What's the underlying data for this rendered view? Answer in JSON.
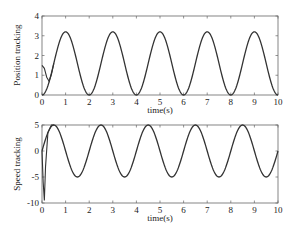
{
  "chart_data": [
    {
      "type": "line",
      "title": "",
      "xlabel": "time(s)",
      "ylabel": "Position tracking",
      "xlim": [
        0,
        10
      ],
      "ylim": [
        0,
        4
      ],
      "xticks": [
        "0",
        "1",
        "2",
        "3",
        "4",
        "5",
        "6",
        "7",
        "8",
        "9",
        "10"
      ],
      "yticks": [
        "0",
        "1",
        "2",
        "3",
        "4"
      ],
      "grid": false,
      "legend": null,
      "series": [
        {
          "name": "reference",
          "description": "1.6 - 1.6*cos(pi*t)",
          "x": [
            0,
            0.5,
            1,
            1.5,
            2,
            2.5,
            3,
            3.5,
            4,
            4.5,
            5,
            5.5,
            6,
            6.5,
            7,
            7.5,
            8,
            8.5,
            9,
            9.5,
            10
          ],
          "values": [
            0,
            1.6,
            3.2,
            1.6,
            0,
            1.6,
            3.2,
            1.6,
            0,
            1.6,
            3.2,
            1.6,
            0,
            1.6,
            3.2,
            1.6,
            0,
            1.6,
            3.2,
            1.6,
            0
          ]
        },
        {
          "name": "actual",
          "description": "starts ~1.5, dips to ~0.7 near t=0.3, converges to reference by t~0.5",
          "x": [
            0,
            0.1,
            0.2,
            0.3,
            0.4,
            0.5
          ],
          "values": [
            1.5,
            1.35,
            0.9,
            0.7,
            1.05,
            1.6
          ]
        }
      ]
    },
    {
      "type": "line",
      "title": "",
      "xlabel": "time(s)",
      "ylabel": "Speed tracking",
      "xlim": [
        0,
        10
      ],
      "ylim": [
        -10,
        5
      ],
      "xticks": [
        "0",
        "1",
        "2",
        "3",
        "4",
        "5",
        "6",
        "7",
        "8",
        "9",
        "10"
      ],
      "yticks": [
        "-10",
        "-5",
        "0",
        "5"
      ],
      "grid": false,
      "legend": null,
      "series": [
        {
          "name": "reference",
          "description": "5*sin(pi*t)",
          "x": [
            0,
            0.5,
            1,
            1.5,
            2,
            2.5,
            3,
            3.5,
            4,
            4.5,
            5,
            5.5,
            6,
            6.5,
            7,
            7.5,
            8,
            8.5,
            9,
            9.5,
            10
          ],
          "values": [
            0,
            5,
            0,
            -5,
            0,
            5,
            0,
            -5,
            0,
            5,
            0,
            -5,
            0,
            5,
            0,
            -5,
            0,
            5,
            0,
            -5,
            0
          ]
        },
        {
          "name": "actual",
          "description": "starts ~0, sharp dip to ~-9.5 near t=0.1, overshoots and merges with reference by t~0.5",
          "x": [
            0,
            0.05,
            0.1,
            0.15,
            0.25,
            0.4,
            0.5
          ],
          "values": [
            0,
            -6,
            -9.5,
            -3,
            3.5,
            5,
            5
          ]
        }
      ]
    }
  ],
  "plots": {
    "top": {
      "ylabel": "Position tracking",
      "xlabel": "time(s)"
    },
    "bottom": {
      "ylabel": "Speed tracking",
      "xlabel": "time(s)"
    }
  },
  "colors": {
    "line": "#333333",
    "axis": "#555555",
    "background": "#ffffff"
  }
}
